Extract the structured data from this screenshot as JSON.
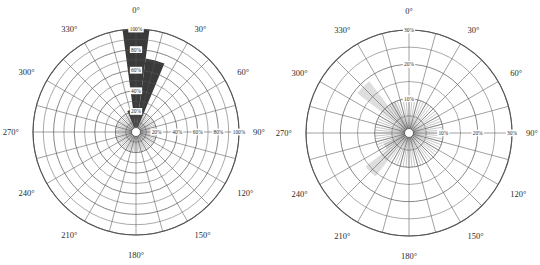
{
  "figure": {
    "background": "#ffffff",
    "panel_count": 2,
    "grid_color": "#555555",
    "text_color": "#2b2b2b"
  },
  "chart_data": [
    {
      "id": "left-polar-rose",
      "type": "bar",
      "subtype": "polar-rose",
      "title": "",
      "xlabel": "",
      "ylabel": "",
      "grid": true,
      "legend": false,
      "theta_direction": "clockwise",
      "theta_zero_location": "N",
      "angle_tick_labels": [
        "0°",
        "30°",
        "60°",
        "90°",
        "120°",
        "150°",
        "180°",
        "210°",
        "240°",
        "270°",
        "300°",
        "330°"
      ],
      "angle_ticks": [
        0,
        30,
        60,
        90,
        120,
        150,
        180,
        210,
        240,
        270,
        300,
        330
      ],
      "sector_count": 24,
      "sector_width_deg": 15,
      "radial_tick_labels": [
        "20%",
        "40%",
        "60%",
        "80%",
        "100%"
      ],
      "radial_ticks": [
        20,
        40,
        60,
        80,
        100
      ],
      "rlim": [
        0,
        100
      ],
      "radial_axis_labels_vertical": [
        "20%",
        "40%",
        "60%",
        "80%",
        "100%"
      ],
      "radial_axis_labels_horizontal": [
        "20%",
        "40%",
        "60%",
        "80%",
        "100%"
      ],
      "fill_color": "#3a3a3a",
      "categories": [
        0,
        15,
        30,
        45,
        60,
        75,
        90,
        105,
        120,
        135,
        150,
        165,
        180,
        195,
        210,
        225,
        240,
        255,
        270,
        285,
        300,
        315,
        330,
        345
      ],
      "values": [
        100,
        72,
        0,
        0,
        0,
        0,
        0,
        0,
        0,
        0,
        0,
        0,
        0,
        0,
        0,
        0,
        0,
        0,
        0,
        0,
        0,
        0,
        0,
        22
      ]
    },
    {
      "id": "right-polar-rose",
      "type": "bar",
      "subtype": "polar-rose",
      "title": "",
      "xlabel": "",
      "ylabel": "",
      "grid": true,
      "legend": false,
      "theta_direction": "clockwise",
      "theta_zero_location": "N",
      "angle_tick_labels": [
        "0°",
        "30°",
        "60°",
        "90°",
        "120°",
        "150°",
        "180°",
        "210°",
        "240°",
        "270°",
        "300°",
        "330°"
      ],
      "angle_ticks": [
        0,
        30,
        60,
        90,
        120,
        150,
        180,
        210,
        240,
        270,
        300,
        330
      ],
      "sector_count": 24,
      "sector_width_deg": 15,
      "radial_tick_labels": [
        "10%",
        "20%",
        "30%"
      ],
      "radial_ticks": [
        10,
        20,
        30
      ],
      "rlim": [
        0,
        30
      ],
      "radial_axis_labels_vertical": [
        "10%",
        "20%",
        "30%"
      ],
      "radial_axis_labels_horizontal": [
        "10%",
        "20%",
        "30%"
      ],
      "fill_color": "#dedede",
      "categories": [
        0,
        15,
        30,
        45,
        60,
        75,
        90,
        105,
        120,
        135,
        150,
        165,
        180,
        195,
        210,
        225,
        240,
        255,
        270,
        285,
        300,
        315,
        330,
        345
      ],
      "values": [
        0,
        0,
        0,
        0,
        0,
        0,
        0,
        0,
        0,
        0,
        0,
        0,
        0,
        0,
        0,
        16,
        8,
        0,
        0,
        0,
        0,
        19,
        10,
        0
      ]
    }
  ]
}
